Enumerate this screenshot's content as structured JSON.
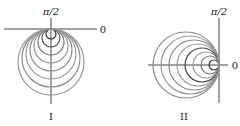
{
  "figures": [
    {
      "id": "I",
      "caption": "I",
      "axis_labels": {
        "vertical": "π/2",
        "horizontal": "0"
      },
      "origin": [
        51,
        29
      ],
      "direction": "down",
      "circle_radii": [
        5,
        9,
        13,
        17,
        21,
        25,
        29,
        33
      ],
      "circle_colors": [
        "#333333",
        "#555555",
        "#777777",
        "#999999",
        "#888888",
        "#999999",
        "#8a8a8a",
        "#999999"
      ]
    },
    {
      "id": "II",
      "caption": "II",
      "axis_labels": {
        "vertical": "π/2",
        "horizontal": "0"
      },
      "origin": [
        219,
        65
      ],
      "direction": "left",
      "circle_radii": [
        5,
        9,
        13,
        17,
        21,
        25,
        29,
        33
      ],
      "circle_colors": [
        "#333333",
        "#777777",
        "#999999",
        "#444444",
        "#999999",
        "#888888",
        "#999999",
        "#8a8a8a"
      ]
    }
  ]
}
